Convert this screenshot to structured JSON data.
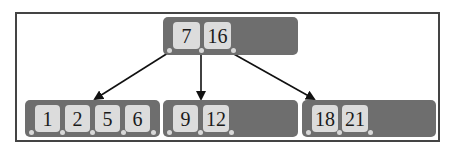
{
  "diagram": {
    "type": "b-tree",
    "root": {
      "keys": [
        "7",
        "16"
      ]
    },
    "children": [
      {
        "keys": [
          "1",
          "2",
          "5",
          "6"
        ]
      },
      {
        "keys": [
          "9",
          "12"
        ]
      },
      {
        "keys": [
          "18",
          "21"
        ]
      }
    ],
    "colors": {
      "node_fill": "#6e6e6e",
      "key_fill": "#dcdcdc",
      "arrow": "#111111",
      "frame": "#444444"
    }
  }
}
